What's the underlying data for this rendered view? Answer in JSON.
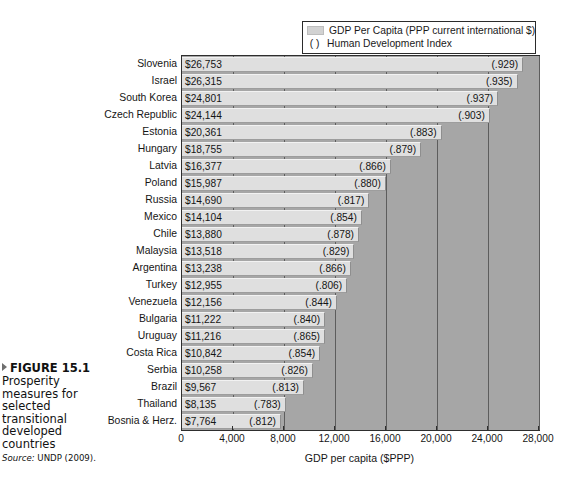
{
  "figure": {
    "marker_icon": "triangle-right-icon",
    "label": "FIGURE 15.1",
    "caption": "Prosperity measures for selected transitional developed countries",
    "source_prefix": "Source:",
    "source_text": " UNDP (2009)."
  },
  "legend": {
    "items": [
      {
        "marker": "bar-swatch",
        "label": "GDP Per Capita (PPP current international $)"
      },
      {
        "marker": "( )",
        "label": "Human Development Index"
      }
    ]
  },
  "axis": {
    "x_title": "GDP per capita ($PPP)",
    "x_ticks": [
      "0",
      "4,000",
      "8,000",
      "12,000",
      "16,000",
      "20,000",
      "24,000",
      "28,000"
    ],
    "x_min": 0,
    "x_max": 28000
  },
  "colors": {
    "plot_background": "#a6a6a6",
    "bar_fill": "#dfdfdf",
    "gridline": "#5d5d5d",
    "frame": "#2e2e2e",
    "legend_swatch": "#d2d2d2"
  },
  "chart_data": {
    "type": "bar",
    "orientation": "horizontal",
    "title": "",
    "subtitle": "",
    "xlabel": "GDP per capita ($PPP)",
    "ylabel": "",
    "xlim": [
      0,
      28000
    ],
    "grid": true,
    "legend_position": "top-right",
    "categories": [
      "Slovenia",
      "Israel",
      "South Korea",
      "Czech Republic",
      "Estonia",
      "Hungary",
      "Latvia",
      "Poland",
      "Russia",
      "Mexico",
      "Chile",
      "Malaysia",
      "Argentina",
      "Turkey",
      "Venezuela",
      "Bulgaria",
      "Uruguay",
      "Costa Rica",
      "Serbia",
      "Brazil",
      "Thailand",
      "Bosnia & Herz."
    ],
    "values": [
      26753,
      26315,
      24801,
      24144,
      20361,
      18755,
      16377,
      15987,
      14690,
      14104,
      13880,
      13518,
      13238,
      12955,
      12156,
      11222,
      11216,
      10842,
      10258,
      9567,
      8135,
      7764
    ],
    "value_labels": [
      "$26,753",
      "$26,315",
      "$24,801",
      "$24,144",
      "$20,361",
      "$18,755",
      "$16,377",
      "$15,987",
      "$14,690",
      "$14,104",
      "$13,880",
      "$13,518",
      "$13,238",
      "$12,955",
      "$12,156",
      "$11,222",
      "$11,216",
      "$10,842",
      "$10,258",
      "$9,567",
      "$8,135",
      "$7,764"
    ],
    "hdi_labels": [
      "(.929)",
      "(.935)",
      "(.937)",
      "(.903)",
      "(.883)",
      "(.879)",
      "(.866)",
      "(.880)",
      "(.817)",
      "(.854)",
      "(.878)",
      "(.829)",
      "(.866)",
      "(.806)",
      "(.844)",
      "(.840)",
      "(.865)",
      "(.854)",
      "(.826)",
      "(.813)",
      "(.783)",
      "(.812)"
    ],
    "hdi_values": [
      0.929,
      0.935,
      0.937,
      0.903,
      0.883,
      0.879,
      0.866,
      0.88,
      0.817,
      0.854,
      0.878,
      0.829,
      0.866,
      0.806,
      0.844,
      0.84,
      0.865,
      0.854,
      0.826,
      0.813,
      0.783,
      0.812
    ],
    "series": [
      {
        "name": "GDP Per Capita (PPP current international $)",
        "values": [
          26753,
          26315,
          24801,
          24144,
          20361,
          18755,
          16377,
          15987,
          14690,
          14104,
          13880,
          13518,
          13238,
          12955,
          12156,
          11222,
          11216,
          10842,
          10258,
          9567,
          8135,
          7764
        ]
      },
      {
        "name": "Human Development Index",
        "values": [
          0.929,
          0.935,
          0.937,
          0.903,
          0.883,
          0.879,
          0.866,
          0.88,
          0.817,
          0.854,
          0.878,
          0.829,
          0.866,
          0.806,
          0.844,
          0.84,
          0.865,
          0.854,
          0.826,
          0.813,
          0.783,
          0.812
        ]
      }
    ]
  }
}
